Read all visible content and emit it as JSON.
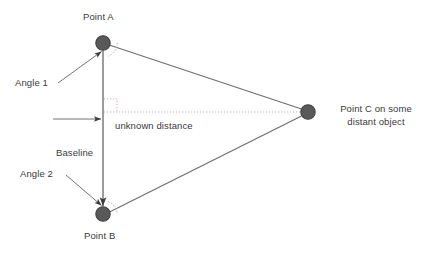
{
  "diagram": {
    "background_color": "#ffffff",
    "labels": {
      "point_a": "Point A",
      "point_b": "Point B",
      "point_c": "Point C on some distant object",
      "angle_1": "Angle 1",
      "angle_2": "Angle 2",
      "baseline": "Baseline",
      "unknown_distance": "unknown distance"
    },
    "colors": {
      "node_fill": "#595959",
      "node_stroke": "#3f3f3f",
      "line": "#6e6e6e",
      "baseline_line": "#5a5a5a",
      "dotted_line": "#c9a9a9",
      "arc": "#b0b0b0",
      "text": "#3a3a3a"
    },
    "nodes": [
      {
        "name": "point-a",
        "cx": 103,
        "cy": 43,
        "r": 7.2
      },
      {
        "name": "point-b",
        "cx": 103,
        "cy": 214,
        "r": 7.2
      },
      {
        "name": "point-c",
        "cx": 308,
        "cy": 112,
        "r": 7.2
      }
    ],
    "edges": [
      {
        "name": "line-a-to-c",
        "x1": 110,
        "y1": 45,
        "x2": 301,
        "y2": 109
      },
      {
        "name": "line-b-to-c",
        "x1": 110,
        "y1": 212,
        "x2": 301,
        "y2": 116
      },
      {
        "name": "baseline",
        "x1": 103,
        "y1": 50,
        "x2": 103,
        "y2": 207
      }
    ],
    "dotted_line": {
      "name": "unknown-distance-line",
      "x1": 104,
      "y1": 112,
      "x2": 300,
      "y2": 112
    },
    "right_angle_marker": {
      "x": 104,
      "y": 98,
      "size": 13
    },
    "pointers": [
      {
        "name": "angle-1-pointer",
        "x1": 58,
        "y1": 83,
        "x2": 102,
        "y2": 51
      },
      {
        "name": "angle-2-pointer",
        "x1": 66,
        "y1": 175,
        "x2": 102,
        "y2": 206
      },
      {
        "name": "unknown-distance-pointer",
        "x1": 53,
        "y1": 119,
        "x2": 101,
        "y2": 119
      }
    ],
    "angle_arcs": [
      {
        "name": "angle-1-arc",
        "cx": 103,
        "cy": 43,
        "r": 14,
        "start_deg": 0,
        "end_deg": 72
      },
      {
        "name": "angle-2-arc",
        "cx": 103,
        "cy": 214,
        "r": 14,
        "start_deg": -60,
        "end_deg": 0
      }
    ]
  }
}
